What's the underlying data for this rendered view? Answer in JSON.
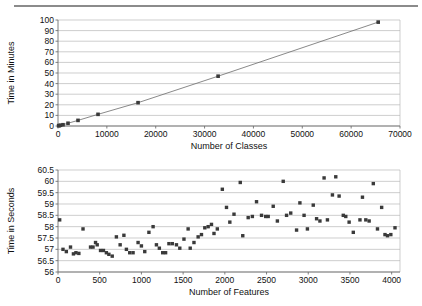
{
  "page": {
    "background_color": "#ffffff",
    "rule_color": "#8b8b8b"
  },
  "chart_data": [
    {
      "id": "classes-scaling",
      "type": "scatter",
      "title": "",
      "subtitle": "",
      "xlabel": "Number of Classes",
      "ylabel": "Time in Minutes",
      "xlim": [
        0,
        70000
      ],
      "ylim": [
        0,
        100
      ],
      "xticks": [
        0,
        10000,
        20000,
        30000,
        40000,
        50000,
        60000,
        70000
      ],
      "xtick_labels": [
        "0",
        "10000",
        "20000",
        "30000",
        "40000",
        "50000",
        "60000",
        "70000"
      ],
      "yticks": [
        0,
        10,
        20,
        30,
        40,
        50,
        60,
        70,
        80,
        90,
        100
      ],
      "ytick_labels": [
        "0",
        "10",
        "20",
        "30",
        "40",
        "50",
        "60",
        "70",
        "80",
        "90",
        "100"
      ],
      "grid": "horizontal",
      "legend": "none",
      "marker": "square",
      "marker_color": "#3a3a3a",
      "line_color": "#6b6b6b",
      "has_connecting_line": true,
      "x": [
        128,
        256,
        512,
        1024,
        2048,
        4096,
        8192,
        16384,
        32768,
        65536
      ],
      "y": [
        0.3,
        0.4,
        0.7,
        1.2,
        2.6,
        5.3,
        11.0,
        22.0,
        47.0,
        98.0
      ],
      "points": [
        {
          "x": 128,
          "y": 0.3
        },
        {
          "x": 256,
          "y": 0.4
        },
        {
          "x": 512,
          "y": 0.7
        },
        {
          "x": 1024,
          "y": 1.2
        },
        {
          "x": 2048,
          "y": 2.6
        },
        {
          "x": 4096,
          "y": 5.3
        },
        {
          "x": 8192,
          "y": 11.0
        },
        {
          "x": 16384,
          "y": 22.0
        },
        {
          "x": 32768,
          "y": 47.0
        },
        {
          "x": 65536,
          "y": 98.0
        }
      ]
    },
    {
      "id": "features-scaling",
      "type": "scatter",
      "title": "",
      "subtitle": "",
      "xlabel": "Number of Features",
      "ylabel": "Time in Seconds",
      "xlim": [
        0,
        4100
      ],
      "ylim": [
        56,
        60.5
      ],
      "xticks": [
        0,
        500,
        1000,
        1500,
        2000,
        2500,
        3000,
        3500,
        4000
      ],
      "xtick_labels": [
        "0",
        "500",
        "1000",
        "1500",
        "2000",
        "2500",
        "3000",
        "3500",
        "4000"
      ],
      "yticks": [
        56,
        56.5,
        57,
        57.5,
        58,
        58.5,
        59,
        59.5,
        60,
        60.5
      ],
      "ytick_labels": [
        "56",
        "56.5",
        "57",
        "57.5",
        "58",
        "58.5",
        "59",
        "59.5",
        "60",
        "60.5"
      ],
      "grid": "horizontal",
      "legend": "none",
      "marker": "square",
      "marker_color": "#3a3a3a",
      "has_connecting_line": false,
      "points": [
        {
          "x": 20,
          "y": 58.3
        },
        {
          "x": 60,
          "y": 57.0
        },
        {
          "x": 100,
          "y": 56.9
        },
        {
          "x": 150,
          "y": 57.1
        },
        {
          "x": 185,
          "y": 56.8
        },
        {
          "x": 215,
          "y": 56.85
        },
        {
          "x": 250,
          "y": 56.82
        },
        {
          "x": 300,
          "y": 57.9
        },
        {
          "x": 390,
          "y": 57.1
        },
        {
          "x": 420,
          "y": 57.1
        },
        {
          "x": 450,
          "y": 57.3
        },
        {
          "x": 470,
          "y": 57.2
        },
        {
          "x": 510,
          "y": 56.95
        },
        {
          "x": 545,
          "y": 56.95
        },
        {
          "x": 580,
          "y": 56.85
        },
        {
          "x": 610,
          "y": 56.78
        },
        {
          "x": 650,
          "y": 56.7
        },
        {
          "x": 700,
          "y": 57.55
        },
        {
          "x": 745,
          "y": 57.2
        },
        {
          "x": 790,
          "y": 57.62
        },
        {
          "x": 820,
          "y": 57.0
        },
        {
          "x": 860,
          "y": 56.85
        },
        {
          "x": 900,
          "y": 56.85
        },
        {
          "x": 960,
          "y": 57.3
        },
        {
          "x": 1000,
          "y": 57.15
        },
        {
          "x": 1040,
          "y": 56.9
        },
        {
          "x": 1090,
          "y": 57.75
        },
        {
          "x": 1140,
          "y": 58.0
        },
        {
          "x": 1180,
          "y": 57.2
        },
        {
          "x": 1215,
          "y": 57.05
        },
        {
          "x": 1255,
          "y": 56.85
        },
        {
          "x": 1290,
          "y": 56.85
        },
        {
          "x": 1330,
          "y": 57.25
        },
        {
          "x": 1370,
          "y": 57.25
        },
        {
          "x": 1420,
          "y": 57.2
        },
        {
          "x": 1460,
          "y": 57.05
        },
        {
          "x": 1510,
          "y": 57.45
        },
        {
          "x": 1560,
          "y": 57.9
        },
        {
          "x": 1585,
          "y": 57.05
        },
        {
          "x": 1630,
          "y": 57.3
        },
        {
          "x": 1680,
          "y": 57.55
        },
        {
          "x": 1720,
          "y": 57.65
        },
        {
          "x": 1760,
          "y": 57.95
        },
        {
          "x": 1800,
          "y": 58.0
        },
        {
          "x": 1840,
          "y": 58.1
        },
        {
          "x": 1870,
          "y": 57.7
        },
        {
          "x": 1910,
          "y": 57.9
        },
        {
          "x": 1970,
          "y": 59.65
        },
        {
          "x": 2020,
          "y": 58.85
        },
        {
          "x": 2060,
          "y": 58.2
        },
        {
          "x": 2110,
          "y": 58.55
        },
        {
          "x": 2185,
          "y": 59.95
        },
        {
          "x": 2215,
          "y": 57.6
        },
        {
          "x": 2280,
          "y": 58.4
        },
        {
          "x": 2330,
          "y": 58.45
        },
        {
          "x": 2380,
          "y": 59.1
        },
        {
          "x": 2440,
          "y": 58.5
        },
        {
          "x": 2490,
          "y": 58.45
        },
        {
          "x": 2520,
          "y": 58.45
        },
        {
          "x": 2580,
          "y": 58.9
        },
        {
          "x": 2630,
          "y": 58.25
        },
        {
          "x": 2700,
          "y": 60.0
        },
        {
          "x": 2740,
          "y": 58.5
        },
        {
          "x": 2790,
          "y": 58.6
        },
        {
          "x": 2860,
          "y": 57.85
        },
        {
          "x": 2900,
          "y": 59.05
        },
        {
          "x": 2950,
          "y": 58.5
        },
        {
          "x": 2990,
          "y": 57.9
        },
        {
          "x": 3060,
          "y": 58.95
        },
        {
          "x": 3100,
          "y": 58.35
        },
        {
          "x": 3140,
          "y": 58.25
        },
        {
          "x": 3190,
          "y": 60.15
        },
        {
          "x": 3230,
          "y": 58.3
        },
        {
          "x": 3290,
          "y": 59.4
        },
        {
          "x": 3330,
          "y": 60.2
        },
        {
          "x": 3370,
          "y": 59.35
        },
        {
          "x": 3420,
          "y": 58.5
        },
        {
          "x": 3450,
          "y": 58.45
        },
        {
          "x": 3490,
          "y": 58.2
        },
        {
          "x": 3540,
          "y": 57.75
        },
        {
          "x": 3620,
          "y": 58.3
        },
        {
          "x": 3650,
          "y": 59.3
        },
        {
          "x": 3690,
          "y": 58.3
        },
        {
          "x": 3730,
          "y": 58.25
        },
        {
          "x": 3780,
          "y": 59.9
        },
        {
          "x": 3830,
          "y": 57.9
        },
        {
          "x": 3880,
          "y": 58.85
        },
        {
          "x": 3920,
          "y": 57.65
        },
        {
          "x": 3950,
          "y": 57.6
        },
        {
          "x": 3990,
          "y": 57.65
        },
        {
          "x": 4040,
          "y": 57.95
        }
      ]
    }
  ]
}
